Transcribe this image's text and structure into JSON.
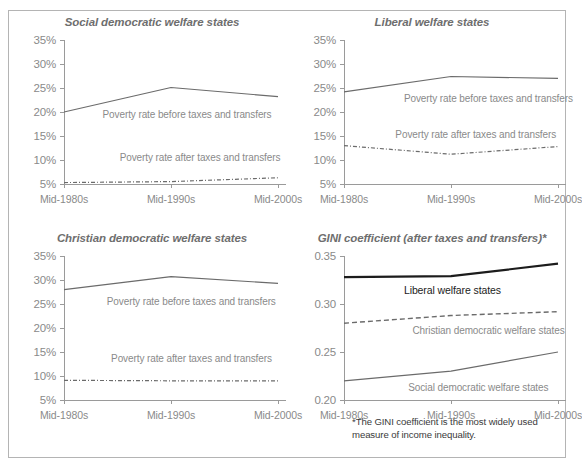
{
  "figure": {
    "background": "#ffffff",
    "border_color": "#b4b4b4",
    "axis_color": "#9a9a9a",
    "text_color": "#8a8a8a",
    "title_color": "#6e6e6e",
    "line_color": "#6b6b6b",
    "line_color_dark": "#1c1c1c"
  },
  "footnote": {
    "text": "*The GINI coefficient is the most widely used measure of income inequality."
  },
  "chart_data": [
    {
      "id": "social-democratic",
      "type": "line",
      "title": "Social democratic welfare states",
      "xlabel": "",
      "ylabel": "",
      "categories": [
        "Mid-1980s",
        "Mid-1990s",
        "Mid-2000s"
      ],
      "ylim": [
        5,
        35
      ],
      "yticks": [
        5,
        10,
        15,
        20,
        25,
        30,
        35
      ],
      "ytick_labels": [
        "5%",
        "10%",
        "15%",
        "20%",
        "25%",
        "30%",
        "35%"
      ],
      "grid": false,
      "legend_position": "inline",
      "series": [
        {
          "name": "Poverty rate before taxes and transfers",
          "style": "solid",
          "values": [
            20.0,
            25.1,
            23.2
          ]
        },
        {
          "name": "Poverty rate after taxes and transfers",
          "style": "dash-dot",
          "values": [
            5.3,
            5.5,
            6.3
          ]
        }
      ]
    },
    {
      "id": "liberal",
      "type": "line",
      "title": "Liberal welfare states",
      "xlabel": "",
      "ylabel": "",
      "categories": [
        "Mid-1980s",
        "Mid-1990s",
        "Mid-2000s"
      ],
      "ylim": [
        5,
        35
      ],
      "yticks": [
        5,
        10,
        15,
        20,
        25,
        30,
        35
      ],
      "ytick_labels": [
        "5%",
        "10%",
        "15%",
        "20%",
        "25%",
        "30%",
        "35%"
      ],
      "grid": false,
      "legend_position": "inline",
      "series": [
        {
          "name": "Poverty rate before taxes and transfers",
          "style": "solid",
          "values": [
            24.2,
            27.4,
            27.0
          ]
        },
        {
          "name": "Poverty rate after taxes and transfers",
          "style": "dash-dot",
          "values": [
            13.0,
            11.2,
            12.8
          ]
        }
      ]
    },
    {
      "id": "christian-democratic",
      "type": "line",
      "title": "Christian democratic welfare states",
      "xlabel": "",
      "ylabel": "",
      "categories": [
        "Mid-1980s",
        "Mid-1990s",
        "Mid-2000s"
      ],
      "ylim": [
        5,
        35
      ],
      "yticks": [
        5,
        10,
        15,
        20,
        25,
        30,
        35
      ],
      "ytick_labels": [
        "5%",
        "10%",
        "15%",
        "20%",
        "25%",
        "30%",
        "35%"
      ],
      "grid": false,
      "legend_position": "inline",
      "series": [
        {
          "name": "Poverty rate before taxes and transfers",
          "style": "solid",
          "values": [
            28.0,
            30.7,
            29.3
          ]
        },
        {
          "name": "Poverty rate after taxes and transfers",
          "style": "dash-dot",
          "values": [
            9.1,
            9.0,
            9.0
          ]
        }
      ]
    },
    {
      "id": "gini",
      "type": "line",
      "title": "GINI coefficient (after taxes and transfers)*",
      "xlabel": "",
      "ylabel": "",
      "categories": [
        "Mid-1980s",
        "Mid-1990s",
        "Mid-2000s"
      ],
      "ylim": [
        0.2,
        0.35
      ],
      "yticks": [
        0.2,
        0.25,
        0.3,
        0.35
      ],
      "ytick_labels": [
        "0.20",
        "0.25",
        "0.30",
        "0.35"
      ],
      "grid": false,
      "legend_position": "inline",
      "series": [
        {
          "name": "Liberal welfare states",
          "style": "solid-bold",
          "values": [
            0.328,
            0.329,
            0.342
          ]
        },
        {
          "name": "Christian democratic welfare states",
          "style": "dashed",
          "values": [
            0.28,
            0.288,
            0.292
          ]
        },
        {
          "name": "Social democratic welfare states",
          "style": "solid",
          "values": [
            0.22,
            0.23,
            0.25
          ]
        }
      ]
    }
  ]
}
